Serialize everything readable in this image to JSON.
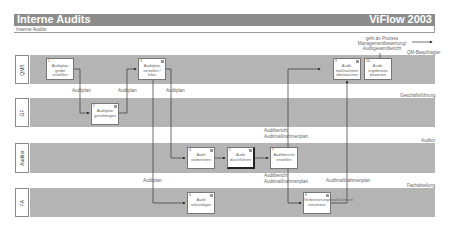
{
  "header": {
    "title": "Interne Audits",
    "brand": "ViFlow 2003",
    "subtitle": "Interne Audits"
  },
  "external": {
    "note_lines": [
      "geht an Prozess",
      "Managementbewertung/",
      "Auditgesamtbericht"
    ],
    "role": "QM-Beauftragter"
  },
  "lanes": [
    {
      "label": "QMB",
      "role": "QM-Beauftragter"
    },
    {
      "label": "GF",
      "role": "Geschäftsführung"
    },
    {
      "label": "Auditor",
      "role": "Auditor"
    },
    {
      "label": "FA",
      "role": "Fachabteilung"
    }
  ],
  "activities": [
    {
      "num": "1",
      "text": "Auditplan grobe erstellen"
    },
    {
      "num": "2",
      "text": "Auditplan genehmigen"
    },
    {
      "num": "3",
      "text": "Auditplan verteilen / Infos"
    },
    {
      "num": "4",
      "text": "Audit vorbereiten"
    },
    {
      "num": "5",
      "text": "Audit durchführen"
    },
    {
      "num": "6",
      "text": "Audit ankündigen"
    },
    {
      "num": "7",
      "text": "Auditbericht erstellen"
    },
    {
      "num": "8",
      "text": "Verbesserungsmaßnahmen umsetzen"
    },
    {
      "num": "9",
      "text": "Audit-maßnahmen überwachen"
    },
    {
      "num": "10",
      "text": "Audit-ergebnisse bewerten"
    }
  ],
  "flows": {
    "auditplan": "Auditplan",
    "auditbericht": "Auditbericht",
    "auditmassnahmen": "Auditmaßnahmenplan",
    "auditmassnahmen2": "Auditmaßnahmenplan"
  }
}
